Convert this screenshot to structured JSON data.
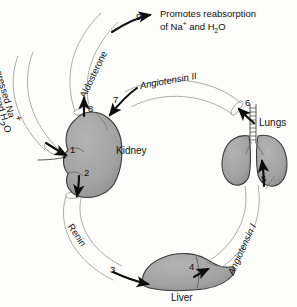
{
  "diagram": {
    "colors": {
      "background": "#fdfdfc",
      "organ_fill": "#a3a3a3",
      "organ_fill_dark": "#8f8f8f",
      "organ_outline": "#3a3a3a",
      "band_outline": "#9a9a9a",
      "arrow": "#0d0d0d",
      "text": "#101010"
    },
    "organs": [
      {
        "id": "kidney",
        "label": "Kidney"
      },
      {
        "id": "lungs",
        "label": "Lungs"
      },
      {
        "id": "liver",
        "label": "Liver"
      }
    ],
    "flow_labels": [
      {
        "id": "aldosterone",
        "text": "Aldosterone",
        "italic": false
      },
      {
        "id": "angiotensin-2",
        "text": "Angiotensin II",
        "italic": true
      },
      {
        "id": "angiotensin-1",
        "text": "Angiotensin I",
        "italic": true
      },
      {
        "id": "renin",
        "text": "Renin",
        "italic": false
      }
    ],
    "stimulus": {
      "line1_prefix": "Depressed Na",
      "line1_sup": "+",
      "line2_prefix": "Depressed H",
      "line2_sub": "2",
      "line2_suffix": "O"
    },
    "outcome": {
      "line1": "Promotes reabsorption",
      "line2_prefix": "of Na",
      "line2_sup": "+",
      "line2_mid": " and H",
      "line2_sub": "2",
      "line2_suffix": "O"
    },
    "steps": [
      {
        "num": "1",
        "meaning": "depressed-sodium-water-stimulus-to-kidney"
      },
      {
        "num": "2",
        "meaning": "kidney-releases-renin"
      },
      {
        "num": "3",
        "meaning": "renin-reaches-liver"
      },
      {
        "num": "4",
        "meaning": "liver-produces-angiotensin-i"
      },
      {
        "num": "5",
        "meaning": "angiotensin-i-reaches-lungs"
      },
      {
        "num": "6",
        "meaning": "lungs-convert-to-angiotensin-ii"
      },
      {
        "num": "7",
        "meaning": "angiotensin-ii-travels-to-kidney"
      },
      {
        "num": "8",
        "meaning": "kidney-stimulates-aldosterone"
      },
      {
        "num": "9",
        "meaning": "aldosterone-promotes-reabsorption"
      }
    ]
  }
}
